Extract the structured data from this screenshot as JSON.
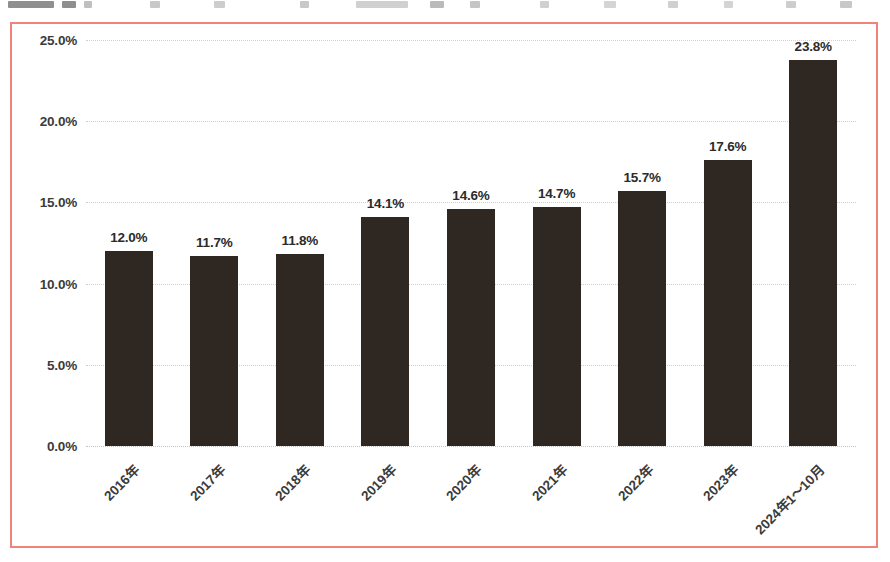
{
  "frame": {
    "border_color": "#f0837a",
    "background": "#ffffff"
  },
  "chart_data": {
    "type": "bar",
    "title": "",
    "xlabel": "",
    "ylabel": "",
    "categories": [
      "2016年",
      "2017年",
      "2018年",
      "2019年",
      "2020年",
      "2021年",
      "2022年",
      "2023年",
      "2024年1～10月"
    ],
    "values": [
      12.0,
      11.7,
      11.8,
      14.1,
      14.6,
      14.7,
      15.7,
      17.6,
      23.8
    ],
    "data_labels": [
      "12.0%",
      "11.7%",
      "11.8%",
      "14.1%",
      "14.6%",
      "14.7%",
      "15.7%",
      "17.6%",
      "23.8%"
    ],
    "ylim": [
      0,
      25
    ],
    "ytick_values": [
      0,
      5,
      10,
      15,
      20,
      25
    ],
    "ytick_labels": [
      "0.0%",
      "5.0%",
      "10.0%",
      "15.0%",
      "20.0%",
      "25.0%"
    ],
    "grid": true,
    "grid_axis": "y",
    "grid_style": "dotted",
    "grid_color": "#cfcfcf",
    "legend": false,
    "bar_color": "#2f2722",
    "label_rotation_deg": -45,
    "units": "percent"
  }
}
